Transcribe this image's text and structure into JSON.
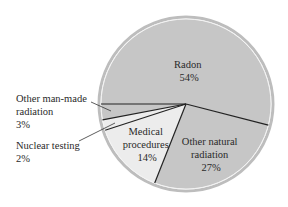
{
  "chart_data": {
    "type": "pie",
    "title": "",
    "categories": [
      "Radon",
      "Other natural radiation",
      "Medical procedures",
      "Nuclear testing",
      "Other man-made radiation"
    ],
    "values": [
      54,
      27,
      14,
      2,
      3
    ],
    "unit": "%",
    "start_angle_deg": 180,
    "direction": "clockwise",
    "colors": [
      "#c6c6c6",
      "#c6c6c6",
      "#ececec",
      "#ececec",
      "#c6c6c6"
    ],
    "labels": [
      {
        "lines": [
          "Radon",
          "54%"
        ],
        "placement": "inside"
      },
      {
        "lines": [
          "Other natural",
          "radiation",
          "27%"
        ],
        "placement": "inside"
      },
      {
        "lines": [
          "Medical",
          "procedures",
          "14%"
        ],
        "placement": "inside"
      },
      {
        "lines": [
          "Nuclear testing",
          "2%"
        ],
        "placement": "outside-leader"
      },
      {
        "lines": [
          "Other man-made",
          "radiation",
          "3%"
        ],
        "placement": "outside-leader"
      }
    ],
    "legend": "none",
    "grid": false
  },
  "style": {
    "rim_color": "#b5b5b5",
    "edge_color": "#222222",
    "background": "#ffffff"
  }
}
